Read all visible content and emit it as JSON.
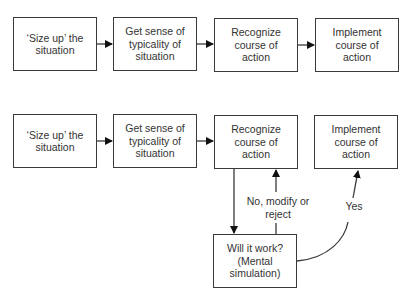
{
  "diagram": {
    "row1": [
      {
        "label": "‘Size up’ the situation"
      },
      {
        "label": "Get sense of typicality of situation"
      },
      {
        "label": "Recognize course of action"
      },
      {
        "label": "Implement course of action"
      }
    ],
    "row2": [
      {
        "label": "‘Size up’ the situation"
      },
      {
        "label": "Get sense of typicality of situation"
      },
      {
        "label": "Recognize course of action"
      },
      {
        "label": "Implement course of action"
      }
    ],
    "simulation_box": {
      "label": "Will it work? (Mental simulation)"
    },
    "edge_labels": {
      "no": "No, modify or reject",
      "yes": "Yes"
    },
    "colors": {
      "stroke": "#3a3a3a",
      "text": "#333333",
      "background": "#ffffff"
    }
  }
}
